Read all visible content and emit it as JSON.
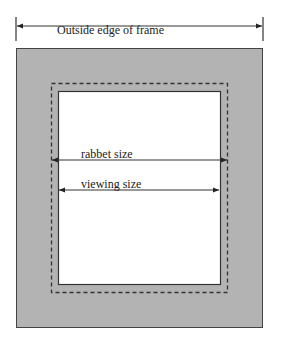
{
  "diagram": {
    "labels": {
      "outside": "Outside edge of frame",
      "rabbet": "rabbet size",
      "viewing": "viewing size"
    },
    "colors": {
      "frame_fill": "#b3b3b3",
      "opening_fill": "#ffffff",
      "stroke": "#333333",
      "background": "#ffffff"
    }
  }
}
